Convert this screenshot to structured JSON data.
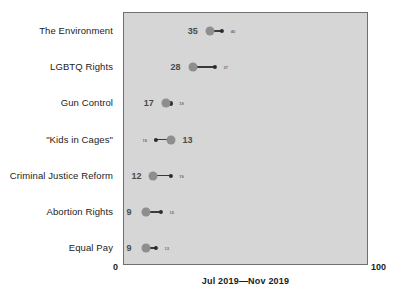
{
  "chart_data": {
    "type": "scatter",
    "subtype": "dumbbell",
    "title": "",
    "xlabel": "Jul 2019—Nov 2019",
    "ylabel": "",
    "xlim": [
      0,
      100
    ],
    "grid": false,
    "legend": false,
    "axis_min_label": "0",
    "axis_max_label": "100",
    "categories": [
      "The Environment",
      "LGBTQ Rights",
      "Gun Control",
      "\"Kids in Cages\"",
      "Criminal Justice Reform",
      "Abortion Rights",
      "Equal Pay"
    ],
    "series": [
      {
        "name": "Jul 2019",
        "values": [
          35,
          28,
          17,
          19,
          12,
          9,
          9
        ]
      },
      {
        "name": "Nov 2019",
        "values": [
          40,
          37,
          19,
          13,
          19,
          15,
          13
        ]
      }
    ],
    "points": [
      {
        "category": "The Environment",
        "start": 35,
        "end": 40,
        "start_label": "35",
        "end_label": "40",
        "reversed": false
      },
      {
        "category": "LGBTQ Rights",
        "start": 28,
        "end": 37,
        "start_label": "28",
        "end_label": "37",
        "reversed": false
      },
      {
        "category": "Gun Control",
        "start": 17,
        "end": 19,
        "start_label": "17",
        "end_label": "19",
        "reversed": false
      },
      {
        "category": "\"Kids in Cages\"",
        "start": 19,
        "end": 13,
        "start_label": "13",
        "end_label": "19",
        "reversed": true
      },
      {
        "category": "Criminal Justice Reform",
        "start": 12,
        "end": 19,
        "start_label": "12",
        "end_label": "19",
        "reversed": false
      },
      {
        "category": "Abortion Rights",
        "start": 9,
        "end": 15,
        "start_label": "9",
        "end_label": "15",
        "reversed": false
      },
      {
        "category": "Equal Pay",
        "start": 9,
        "end": 13,
        "start_label": "9",
        "end_label": "13",
        "reversed": false
      }
    ],
    "colors": {
      "plot_background": "#d6d6d6",
      "plot_border": "#6f6f6f",
      "start_dot": "#8e8e8e",
      "end_dot": "#2b2b2b",
      "connector": "#3a3a3a",
      "main_value_text": "#4a4a4a",
      "small_value_text": "#6a6a6a",
      "category_text": "#1b1b1b"
    }
  }
}
